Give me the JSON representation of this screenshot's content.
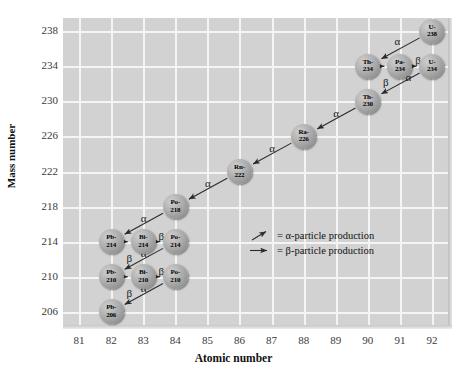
{
  "chart_data": {
    "type": "scatter",
    "title": "",
    "xlabel": "Atomic number",
    "ylabel": "Mass number",
    "xlim": [
      80.5,
      92.5
    ],
    "ylim": [
      204.5,
      239.5
    ],
    "xticks": [
      "81",
      "82",
      "83",
      "84",
      "85",
      "86",
      "87",
      "88",
      "89",
      "90",
      "91",
      "92"
    ],
    "yticks": [
      "206",
      "210",
      "214",
      "218",
      "222",
      "226",
      "230",
      "234",
      "238"
    ],
    "grid": true,
    "legend_position": "center-right",
    "nodes": [
      {
        "id": "U-238",
        "symbol": "U-",
        "mass": "238",
        "z": 92,
        "a": 238
      },
      {
        "id": "Th-234",
        "symbol": "Th-",
        "mass": "234",
        "z": 90,
        "a": 234
      },
      {
        "id": "Pa-234",
        "symbol": "Pa-",
        "mass": "234",
        "z": 91,
        "a": 234
      },
      {
        "id": "U-234",
        "symbol": "U-",
        "mass": "234",
        "z": 92,
        "a": 234
      },
      {
        "id": "Th-230",
        "symbol": "Th-",
        "mass": "230",
        "z": 90,
        "a": 230
      },
      {
        "id": "Ra-226",
        "symbol": "Ra-",
        "mass": "226",
        "z": 88,
        "a": 226
      },
      {
        "id": "Rn-222",
        "symbol": "Rn-",
        "mass": "222",
        "z": 86,
        "a": 222
      },
      {
        "id": "Po-218",
        "symbol": "Po-",
        "mass": "218",
        "z": 84,
        "a": 218
      },
      {
        "id": "Pb-214",
        "symbol": "Pb-",
        "mass": "214",
        "z": 82,
        "a": 214
      },
      {
        "id": "Bi-214",
        "symbol": "Bi-",
        "mass": "214",
        "z": 83,
        "a": 214
      },
      {
        "id": "Po-214",
        "symbol": "Po-",
        "mass": "214",
        "z": 84,
        "a": 214
      },
      {
        "id": "Pb-210",
        "symbol": "Pb-",
        "mass": "210",
        "z": 82,
        "a": 210
      },
      {
        "id": "Bi-210",
        "symbol": "Bi-",
        "mass": "210",
        "z": 83,
        "a": 210
      },
      {
        "id": "Po-210",
        "symbol": "Po-",
        "mass": "210",
        "z": 84,
        "a": 210
      },
      {
        "id": "Pb-206",
        "symbol": "Pb-",
        "mass": "206",
        "z": 82,
        "a": 206
      }
    ],
    "edges": [
      {
        "from": "U-238",
        "to": "Th-234",
        "type": "alpha",
        "label": "α",
        "label_dx": -6,
        "label_dy": -13
      },
      {
        "from": "Th-234",
        "to": "Pa-234",
        "type": "beta",
        "label": "β",
        "label_dx": 0,
        "label_dy": 10
      },
      {
        "from": "Pa-234",
        "to": "U-234",
        "type": "beta",
        "label": "β",
        "label_dx": 0,
        "label_dy": -12
      },
      {
        "from": "U-234",
        "to": "Th-230",
        "type": "alpha",
        "label": "α",
        "label_dx": 5,
        "label_dy": -12
      },
      {
        "from": "Th-230",
        "to": "Ra-226",
        "type": "alpha",
        "label": "α",
        "label_dx": -3,
        "label_dy": -12
      },
      {
        "from": "Ra-226",
        "to": "Rn-222",
        "type": "alpha",
        "label": "α",
        "label_dx": -3,
        "label_dy": -12
      },
      {
        "from": "Rn-222",
        "to": "Po-218",
        "type": "alpha",
        "label": "α",
        "label_dx": -3,
        "label_dy": -12
      },
      {
        "from": "Po-218",
        "to": "Pb-214",
        "type": "alpha",
        "label": "α",
        "label_dx": -3,
        "label_dy": -12
      },
      {
        "from": "Pb-214",
        "to": "Bi-214",
        "type": "beta",
        "label": "β",
        "label_dx": 0,
        "label_dy": 10
      },
      {
        "from": "Bi-214",
        "to": "Po-214",
        "type": "beta",
        "label": "β",
        "label_dx": 0,
        "label_dy": -12
      },
      {
        "from": "Po-214",
        "to": "Pb-210",
        "type": "alpha",
        "label": "α",
        "label_dx": -3,
        "label_dy": -12
      },
      {
        "from": "Pb-210",
        "to": "Bi-210",
        "type": "beta",
        "label": "β",
        "label_dx": 0,
        "label_dy": 10
      },
      {
        "from": "Bi-210",
        "to": "Po-210",
        "type": "beta",
        "label": "β",
        "label_dx": 0,
        "label_dy": -12
      },
      {
        "from": "Po-210",
        "to": "Pb-206",
        "type": "alpha",
        "label": "α",
        "label_dx": -3,
        "label_dy": -12
      }
    ],
    "legend": [
      {
        "glyph": "alpha-arrow",
        "text": "= α-particle production"
      },
      {
        "glyph": "beta-arrow",
        "text": "= β-particle production"
      }
    ],
    "colors": {
      "panel": "#d2d2d2",
      "grid": "#f4f4f4",
      "bubble": "#a8a8a8",
      "arrow": "#2b2b2b",
      "text": "#111111"
    }
  }
}
